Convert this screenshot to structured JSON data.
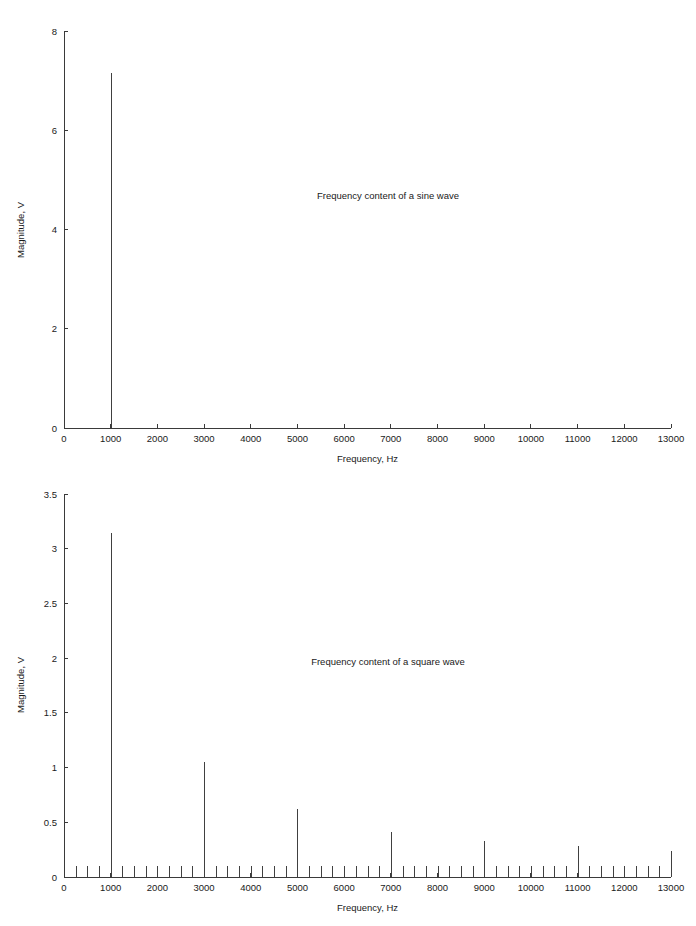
{
  "chart_data": [
    {
      "id": "sine",
      "type": "bar",
      "title": "Frequency content of a sine wave",
      "xlabel": "Frequency, Hz",
      "ylabel": "Magnitude, V",
      "xlim": [
        0,
        13000
      ],
      "ylim": [
        0,
        8
      ],
      "grid": false,
      "legend": null,
      "xticks": [
        0,
        1000,
        2000,
        3000,
        4000,
        5000,
        6000,
        7000,
        8000,
        9000,
        10000,
        11000,
        12000,
        13000
      ],
      "xticklabels": [
        "0",
        "1000",
        "2000",
        "3000",
        "4000",
        "5000",
        "6000",
        "7000",
        "8000",
        "9000",
        "10000",
        "11000",
        "12000",
        "13000"
      ],
      "yticks": [
        0,
        2,
        4,
        6,
        8
      ],
      "yticklabels": [
        "0",
        "2",
        "4",
        "6",
        "8"
      ],
      "x": [
        1000
      ],
      "values": [
        7.15
      ]
    },
    {
      "id": "square",
      "type": "bar",
      "title": "Frequency content of a square wave",
      "xlabel": "Frequency, Hz",
      "ylabel": "Magnitude, V",
      "xlim": [
        0,
        13000
      ],
      "ylim": [
        0,
        3.5
      ],
      "grid": false,
      "legend": null,
      "xticks": [
        0,
        1000,
        2000,
        3000,
        4000,
        5000,
        6000,
        7000,
        8000,
        9000,
        10000,
        11000,
        12000,
        13000
      ],
      "xticklabels": [
        "0",
        "1000",
        "2000",
        "3000",
        "4000",
        "5000",
        "6000",
        "7000",
        "8000",
        "9000",
        "10000",
        "11000",
        "12000",
        "13000"
      ],
      "yticks": [
        0,
        0.5,
        1,
        1.5,
        2,
        2.5,
        3,
        3.5
      ],
      "yticklabels": [
        "0",
        "0.5",
        "1",
        "1.5",
        "2",
        "2.5",
        "3",
        "3.5"
      ],
      "x": [
        250,
        500,
        750,
        1000,
        1250,
        1500,
        1750,
        2000,
        2250,
        2500,
        2750,
        3000,
        3250,
        3500,
        3750,
        4000,
        4250,
        4500,
        4750,
        5000,
        5250,
        5500,
        5750,
        6000,
        6250,
        6500,
        6750,
        7000,
        7250,
        7500,
        7750,
        8000,
        8250,
        8500,
        8750,
        9000,
        9250,
        9500,
        9750,
        10000,
        10250,
        10500,
        10750,
        11000,
        11250,
        11500,
        11750,
        12000,
        12250,
        12500,
        12750,
        13000
      ],
      "values": [
        0.1,
        0.1,
        0.1,
        3.14,
        0.1,
        0.1,
        0.1,
        0.1,
        0.1,
        0.1,
        0.1,
        1.05,
        0.1,
        0.1,
        0.1,
        0.1,
        0.1,
        0.1,
        0.1,
        0.62,
        0.1,
        0.1,
        0.1,
        0.1,
        0.1,
        0.1,
        0.1,
        0.41,
        0.1,
        0.1,
        0.1,
        0.1,
        0.1,
        0.1,
        0.1,
        0.33,
        0.1,
        0.1,
        0.1,
        0.1,
        0.1,
        0.1,
        0.1,
        0.28,
        0.1,
        0.1,
        0.1,
        0.1,
        0.1,
        0.1,
        0.1,
        0.24
      ]
    }
  ]
}
